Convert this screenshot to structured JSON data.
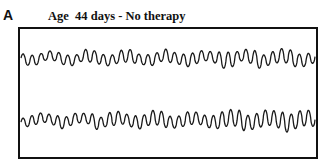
{
  "panel": {
    "letter": "A",
    "title": "Age  44 days - No therapy"
  },
  "traces": [
    {
      "name": "trace-1",
      "baseline_y": 58,
      "cycles": 33,
      "amplitude_start": 10,
      "amplitude_end": 14,
      "color": "#1a1a1a"
    },
    {
      "name": "trace-2",
      "baseline_y": 120,
      "cycles": 34,
      "amplitude_start": 10,
      "amplitude_end": 17,
      "color": "#1a1a1a"
    }
  ],
  "frame": {
    "x": 18,
    "y": 27,
    "width": 296,
    "height": 128
  }
}
